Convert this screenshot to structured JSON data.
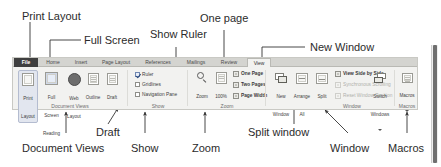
{
  "ribbon": {
    "tabs": [
      {
        "id": "file",
        "label": "File"
      },
      {
        "id": "home",
        "label": "Home"
      },
      {
        "id": "insert",
        "label": "Insert"
      },
      {
        "id": "page-layout",
        "label": "Page Layout"
      },
      {
        "id": "references",
        "label": "References"
      },
      {
        "id": "mailings",
        "label": "Mailings"
      },
      {
        "id": "review",
        "label": "Review"
      },
      {
        "id": "view",
        "label": "View"
      }
    ],
    "active_tab": "View",
    "groups": [
      {
        "id": "document-views",
        "label": "Document Views",
        "buttons": [
          {
            "id": "print-layout",
            "caption": "Print\nLayout",
            "selected": true
          },
          {
            "id": "full-screen-reading",
            "caption": "Full Screen\nReading",
            "selected": false
          },
          {
            "id": "web-layout",
            "caption": "Web\nLayout",
            "selected": false
          },
          {
            "id": "outline",
            "caption": "Outline",
            "selected": false
          },
          {
            "id": "draft",
            "caption": "Draft",
            "selected": false
          }
        ]
      },
      {
        "id": "show",
        "label": "Show",
        "checkboxes": [
          {
            "id": "ruler",
            "label": "Ruler",
            "checked": true
          },
          {
            "id": "gridlines",
            "label": "Gridlines",
            "checked": false
          },
          {
            "id": "navigation-pane",
            "label": "Navigation Pane",
            "checked": false
          }
        ]
      },
      {
        "id": "zoom",
        "label": "Zoom",
        "buttons": [
          {
            "id": "zoom",
            "caption": "Zoom"
          },
          {
            "id": "zoom-100",
            "caption": "100%"
          }
        ],
        "commands": [
          {
            "id": "one-page",
            "label": "One Page"
          },
          {
            "id": "two-pages",
            "label": "Two Pages"
          },
          {
            "id": "page-width",
            "label": "Page Width"
          }
        ]
      },
      {
        "id": "window",
        "label": "Window",
        "buttons": [
          {
            "id": "new-window",
            "caption": "New\nWindow"
          },
          {
            "id": "arrange-all",
            "caption": "Arrange\nAll"
          },
          {
            "id": "split",
            "caption": "Split"
          }
        ],
        "commands": [
          {
            "id": "view-side-by-side",
            "label": "View Side by Side",
            "disabled": false
          },
          {
            "id": "synchronous-scrolling",
            "label": "Synchronous Scrolling",
            "disabled": true
          },
          {
            "id": "reset-window-position",
            "label": "Reset Window Position",
            "disabled": true
          }
        ],
        "menu_buttons": [
          {
            "id": "switch-windows",
            "caption": "Switch\nWindows",
            "has_dropdown": true
          }
        ]
      },
      {
        "id": "macros",
        "label": "Macros",
        "menu_buttons": [
          {
            "id": "macros",
            "caption": "Macros",
            "has_dropdown": true
          }
        ]
      }
    ]
  },
  "annotations": {
    "top": [
      {
        "id": "print-layout",
        "text": "Print Layout"
      },
      {
        "id": "full-screen",
        "text": "Full Screen"
      },
      {
        "id": "show-ruler",
        "text": "Show Ruler"
      },
      {
        "id": "one-page",
        "text": "One page"
      },
      {
        "id": "new-window",
        "text": "New Window"
      }
    ],
    "bottom": [
      {
        "id": "draft",
        "text": "Draft"
      },
      {
        "id": "document-views",
        "text": "Document Views"
      },
      {
        "id": "show",
        "text": "Show"
      },
      {
        "id": "zoom",
        "text": "Zoom"
      },
      {
        "id": "split-window",
        "text": "Split window"
      },
      {
        "id": "window",
        "text": "Window"
      },
      {
        "id": "macros",
        "text": "Macros"
      }
    ]
  },
  "colors": {
    "leader_line": "#333333",
    "ribbon_bg": "#f2f2f0",
    "tabstrip_bg": "#d4d4d0",
    "file_tab_bg": "#3f3f3f",
    "selected_button_bg": "#e2e6ef",
    "text": "#2b2b2b",
    "disabled_text": "#b0b0ac"
  }
}
